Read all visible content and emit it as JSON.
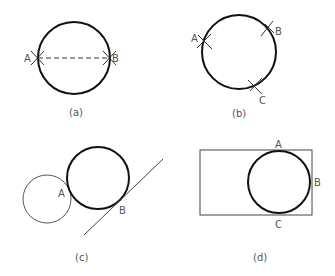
{
  "panels": [
    {
      "id": "a",
      "caption": "(a)",
      "points": {
        "A": "A",
        "B": "B"
      }
    },
    {
      "id": "b",
      "caption": "(b)",
      "points": {
        "A": "A",
        "B": "B",
        "C": "C"
      }
    },
    {
      "id": "c",
      "caption": "(c)",
      "points": {
        "A": "A",
        "B": "B"
      }
    },
    {
      "id": "d",
      "caption": "(d)",
      "points": {
        "A": "A",
        "B": "B",
        "C": "C"
      }
    }
  ],
  "colors": {
    "stroke": "#111111",
    "thin": "#444444",
    "label": "#555555"
  }
}
